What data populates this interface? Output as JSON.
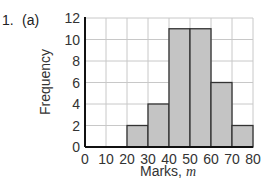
{
  "question": {
    "number": "1.",
    "part": "(a)"
  },
  "chart_data": {
    "type": "bar",
    "subtype": "histogram",
    "title": "",
    "xlabel": "Marks,",
    "xlabel_var": "m",
    "ylabel": "Frequency",
    "bin_edges": [
      0,
      10,
      20,
      30,
      40,
      50,
      60,
      70,
      80
    ],
    "categories": [
      "0-10",
      "10-20",
      "20-30",
      "30-40",
      "40-50",
      "50-60",
      "60-70",
      "70-80"
    ],
    "values": [
      0,
      0,
      2,
      4,
      11,
      11,
      6,
      2
    ],
    "x_ticks": [
      "0",
      "10",
      "20",
      "30",
      "40",
      "50",
      "60",
      "70",
      "80"
    ],
    "y_ticks": [
      "0",
      "2",
      "4",
      "6",
      "8",
      "10",
      "12"
    ],
    "xlim": [
      0,
      80
    ],
    "ylim": [
      0,
      12
    ],
    "grid": true,
    "legend": null,
    "colors": {
      "bar_fill": "#c4c4c4",
      "bar_edge": "#333333",
      "grid": "#c8c8c8",
      "axis": "#111111"
    }
  }
}
